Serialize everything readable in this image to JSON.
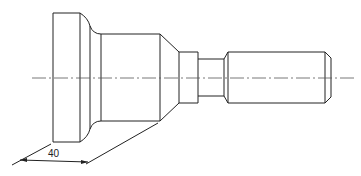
{
  "drawing": {
    "type": "mechanical part side view",
    "dimensions": [
      {
        "label": "40",
        "description": "oblique dimension from flange face to body end"
      }
    ],
    "colors": {
      "line": "#222222",
      "centerline": "#555555",
      "background": "#ffffff"
    }
  }
}
